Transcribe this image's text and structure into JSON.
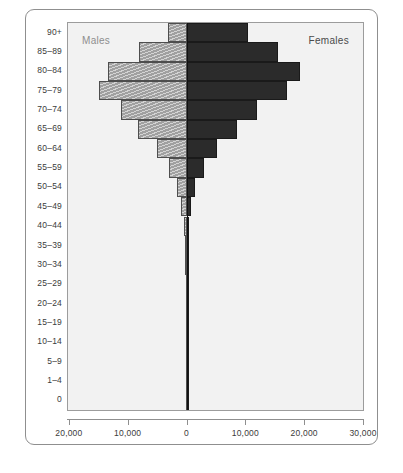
{
  "chart_data": {
    "type": "bar",
    "subtype": "population-pyramid",
    "title": "",
    "xlabel": "",
    "ylabel": "",
    "orientation": "horizontal",
    "grid": false,
    "legend_position": "inside-top",
    "categories": [
      "90+",
      "85–89",
      "80–84",
      "75–79",
      "70–74",
      "65–69",
      "60–64",
      "55–59",
      "50–54",
      "45–49",
      "40–44",
      "35–39",
      "30–34",
      "25–29",
      "20–24",
      "15–19",
      "10–14",
      "5–9",
      "1–4",
      "0"
    ],
    "series": [
      {
        "name": "Males",
        "direction": "left",
        "color": "#a0a0a0",
        "values": [
          3200,
          8100,
          13400,
          14800,
          11200,
          8300,
          5100,
          3000,
          1700,
          900,
          480,
          300,
          210,
          150,
          110,
          80,
          60,
          50,
          60,
          90
        ]
      },
      {
        "name": "Females",
        "direction": "right",
        "color": "#2b2b2b",
        "values": [
          10400,
          15600,
          19300,
          17100,
          12000,
          8600,
          5100,
          2900,
          1500,
          760,
          400,
          250,
          175,
          130,
          95,
          70,
          55,
          45,
          50,
          75
        ]
      }
    ],
    "xticks": [
      {
        "label": "20,000",
        "value": -20000
      },
      {
        "label": "10,000",
        "value": -10000
      },
      {
        "label": "0",
        "value": 0
      },
      {
        "label": "10,000",
        "value": 10000
      },
      {
        "label": "20,000",
        "value": 20000
      },
      {
        "label": "30,000",
        "value": 30000
      }
    ],
    "xlim": [
      -20150,
      30000
    ],
    "annotations": [
      {
        "name": "males-caption",
        "text": "Males"
      },
      {
        "name": "females-caption",
        "text": "Females"
      }
    ]
  }
}
